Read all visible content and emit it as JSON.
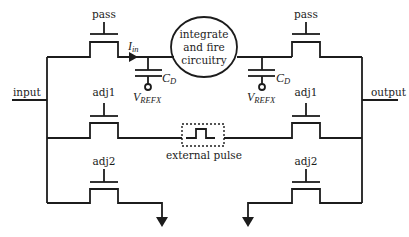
{
  "diagram": {
    "type": "circuit-schematic",
    "labels": {
      "input": "input",
      "output": "output",
      "core_line1": "integrate",
      "core_line2": "and fire",
      "core_line3": "circuitry",
      "current_main": "I",
      "current_sub": "in",
      "cap_left_main": "C",
      "cap_left_sub": "D",
      "cap_right_main": "C",
      "cap_right_sub": "D",
      "vref_left_main": "V",
      "vref_left_sub": "REFX",
      "vref_right_main": "V",
      "vref_right_sub": "REFX",
      "external_pulse": "external pulse"
    },
    "transistors": [
      {
        "id": "left-pass",
        "gate_label": "pass"
      },
      {
        "id": "left-adj1",
        "gate_label": "adj1"
      },
      {
        "id": "left-adj2",
        "gate_label": "adj2"
      },
      {
        "id": "right-pass",
        "gate_label": "pass"
      },
      {
        "id": "right-adj1",
        "gate_label": "adj1"
      },
      {
        "id": "right-adj2",
        "gate_label": "adj2"
      }
    ],
    "colors": {
      "stroke": "#1c1c1c",
      "background": "#ffffff"
    }
  }
}
